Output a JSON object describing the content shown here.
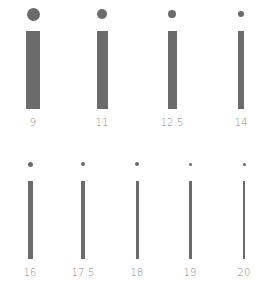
{
  "color": "#6b6b6b",
  "label_color": "#8a8a8a",
  "rows": [
    {
      "items": [
        {
          "label": "9",
          "cx": 33,
          "dot": 13,
          "bar_w": 14
        },
        {
          "label": "11",
          "cx": 102,
          "dot": 10,
          "bar_w": 11
        },
        {
          "label": "12.5",
          "cx": 172,
          "dot": 8,
          "bar_w": 9
        },
        {
          "label": "14",
          "cx": 241,
          "dot": 6,
          "bar_w": 6
        }
      ],
      "dot_y": 14,
      "bar_top": 31,
      "bar_bottom": 109,
      "label_y": 117
    },
    {
      "items": [
        {
          "label": "16",
          "cx": 30,
          "dot": 5,
          "bar_w": 5
        },
        {
          "label": "17.5",
          "cx": 83,
          "dot": 4,
          "bar_w": 4
        },
        {
          "label": "18",
          "cx": 137,
          "dot": 4,
          "bar_w": 3
        },
        {
          "label": "19",
          "cx": 190,
          "dot": 3,
          "bar_w": 3
        },
        {
          "label": "20",
          "cx": 244,
          "dot": 3,
          "bar_w": 2
        }
      ],
      "dot_y": 164,
      "bar_top": 181,
      "bar_bottom": 259,
      "label_y": 267
    }
  ]
}
